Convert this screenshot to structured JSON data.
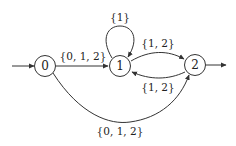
{
  "diagram": {
    "type": "finite-automaton",
    "nodes": [
      {
        "id": "0",
        "label": "0",
        "initial": true,
        "final": false
      },
      {
        "id": "1",
        "label": "1",
        "initial": false,
        "final": false
      },
      {
        "id": "2",
        "label": "2",
        "initial": false,
        "final": true
      }
    ],
    "edges": [
      {
        "from": "0",
        "to": "1",
        "label": "{0, 1, 2}"
      },
      {
        "from": "1",
        "to": "1",
        "label": "{1}"
      },
      {
        "from": "1",
        "to": "2",
        "label": "{1, 2}"
      },
      {
        "from": "2",
        "to": "1",
        "label": "{1, 2}"
      },
      {
        "from": "0",
        "to": "2",
        "label": "{0, 1, 2}"
      }
    ]
  },
  "colors": {
    "stroke": "#333333",
    "text": "#222222",
    "background": "#ffffff"
  }
}
